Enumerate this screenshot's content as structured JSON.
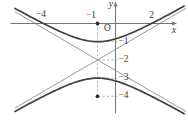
{
  "colors": {
    "curve": "#404040",
    "asymptote": "#8c8c8c",
    "axis": "#757575",
    "dashed": "#a0a0a0",
    "dot": "#303030",
    "text": "#3a3a3a",
    "background": "#ffffff"
  },
  "chart_data": {
    "type": "line",
    "curve": "hyperbola",
    "equation": "(y+2)^2/1 - (x+1)^2/3 = 1",
    "center": {
      "x": -1,
      "y": -2
    },
    "a": 1,
    "b": 1.7320508,
    "transverse_axis": "vertical",
    "vertices": [
      {
        "x": -1,
        "y": -1
      },
      {
        "x": -1,
        "y": -3
      }
    ],
    "foci": [
      {
        "x": -1,
        "y": 0
      },
      {
        "x": -1,
        "y": -4
      }
    ],
    "x_intercepts": [
      -4,
      2
    ],
    "asymptote_slopes": [
      0.57735,
      -0.57735
    ],
    "grid": false,
    "axes": {
      "x_label": "x",
      "y_label": "y",
      "origin_label": "O",
      "x_ticks": [
        {
          "value": -4,
          "label": "−4"
        },
        {
          "value": -1,
          "label": "−1"
        },
        {
          "value": 2,
          "label": "2"
        }
      ],
      "y_ticks": [
        {
          "value": -1,
          "label": "−1"
        },
        {
          "value": -2,
          "label": "−2"
        },
        {
          "value": -3,
          "label": "−3"
        },
        {
          "value": -4,
          "label": "−4"
        }
      ],
      "x_range": [
        -5.6,
        3.9
      ],
      "y_range": [
        -5.5,
        1.3
      ]
    },
    "dashed_guides": {
      "vertical": {
        "x": -1,
        "from_y": 0,
        "to_y": -4
      },
      "horizontal_levels": [
        -1,
        -2,
        -3,
        -4
      ]
    },
    "marked_points": [
      {
        "x": -1,
        "y": 0
      },
      {
        "x": -1,
        "y": -4
      }
    ]
  }
}
